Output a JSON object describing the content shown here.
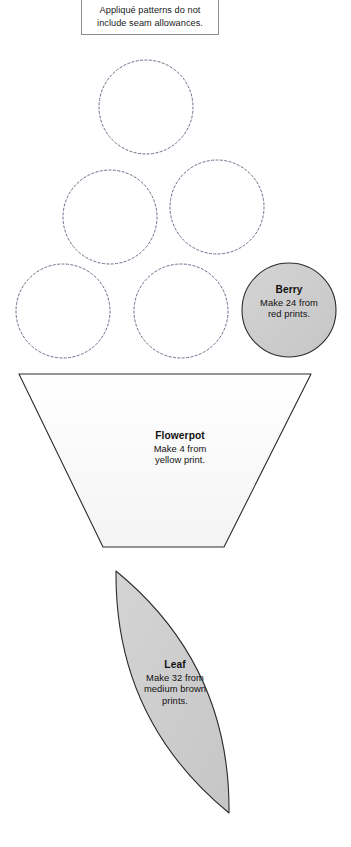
{
  "page": {
    "background_color": "#ffffff",
    "width": 351,
    "height": 847
  },
  "note": {
    "line1": "Appliqué patterns do not",
    "line2": "include seam allowances.",
    "border_color": "#8d8d8d"
  },
  "pieces": [
    {
      "id": "berry",
      "name": "Berry",
      "shape": "circle",
      "title": "Berry",
      "line1": "Make 24 from",
      "line2": "red prints.",
      "fill": "#cdcdcd",
      "stroke": "#2b2b2b",
      "center": {
        "x": 289,
        "y": 310
      },
      "radius": 47
    },
    {
      "id": "flowerpot",
      "name": "Flowerpot",
      "shape": "trapezoid",
      "title": "Flowerpot",
      "line1": "Make 4 from",
      "line2": "yellow print.",
      "fill": "#fbfbfb",
      "stroke": "#2b2b2b",
      "points": "19,374 311,374 224,547 103,547"
    },
    {
      "id": "leaf",
      "name": "Leaf",
      "shape": "lens",
      "title": "Leaf",
      "line1": "Make 32 from",
      "line2": "medium brown",
      "line3": "prints.",
      "fill": "#cdcdcd",
      "stroke": "#2b2b2b",
      "tip_top": {
        "x": 116,
        "y": 571
      },
      "tip_bottom": {
        "x": 229,
        "y": 813
      }
    }
  ],
  "placement_circles": {
    "description": "dashed placement circles",
    "stroke": "#6d6d8a",
    "radius": 47,
    "centers": [
      {
        "x": 146,
        "y": 107
      },
      {
        "x": 110,
        "y": 217
      },
      {
        "x": 217,
        "y": 207
      },
      {
        "x": 63,
        "y": 311
      },
      {
        "x": 181,
        "y": 311
      }
    ]
  }
}
